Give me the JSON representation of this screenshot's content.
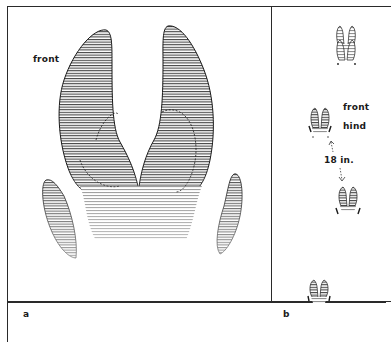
{
  "figure": {
    "panels": [
      {
        "id": "a",
        "panel_label": "a",
        "annotations": {
          "front": "front"
        },
        "description": "large front hoof print of a deer, with two main toes and two dewclaws"
      },
      {
        "id": "b",
        "panel_label": "b",
        "annotations": {
          "front": "front",
          "hind": "hind",
          "stride": "18 in."
        },
        "description": "track pattern showing front and hind prints in a walking gait"
      }
    ],
    "colors": {
      "ink": "#1a1a1a",
      "paper": "#ffffff"
    }
  }
}
